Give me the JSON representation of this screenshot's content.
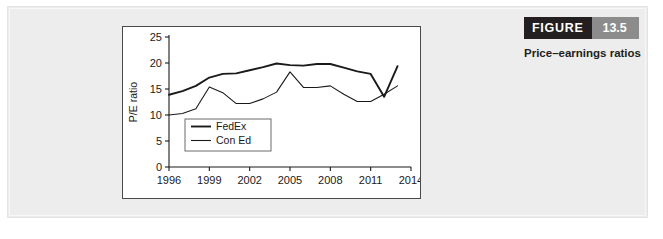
{
  "figure": {
    "label_word": "FIGURE",
    "number": "13.5",
    "caption": "Price–earnings ratios",
    "word_bg": "#231f20",
    "number_bg": "#8c8c8c"
  },
  "chart_data": {
    "type": "line",
    "title": "",
    "xlabel": "",
    "ylabel": "P/E ratio",
    "xlim": [
      1996,
      2014
    ],
    "ylim": [
      0,
      25
    ],
    "xticks": [
      1996,
      1999,
      2002,
      2005,
      2008,
      2011,
      2014
    ],
    "yticks": [
      0,
      5,
      10,
      15,
      20,
      25
    ],
    "grid": false,
    "legend_position": "lower-left",
    "x": [
      1996,
      1997,
      1998,
      1999,
      2000,
      2001,
      2002,
      2003,
      2004,
      2005,
      2006,
      2007,
      2008,
      2009,
      2010,
      2011,
      2012,
      2013
    ],
    "series": [
      {
        "name": "FedEx",
        "color": "#1a1a1a",
        "width": 1.9,
        "values": [
          13.9,
          14.6,
          15.6,
          17.2,
          17.9,
          18.0,
          18.6,
          19.2,
          19.9,
          19.6,
          19.5,
          19.8,
          19.8,
          19.1,
          18.4,
          17.9,
          13.5,
          19.4
        ]
      },
      {
        "name": "Con Ed",
        "color": "#1a1a1a",
        "width": 1.1,
        "values": [
          10.0,
          10.3,
          11.2,
          15.4,
          14.3,
          12.2,
          12.2,
          13.1,
          14.4,
          18.3,
          15.3,
          15.3,
          15.6,
          14.0,
          12.6,
          12.6,
          14.0,
          15.6
        ]
      }
    ],
    "legend": [
      {
        "label": "FedEx"
      },
      {
        "label": "Con Ed"
      }
    ]
  }
}
